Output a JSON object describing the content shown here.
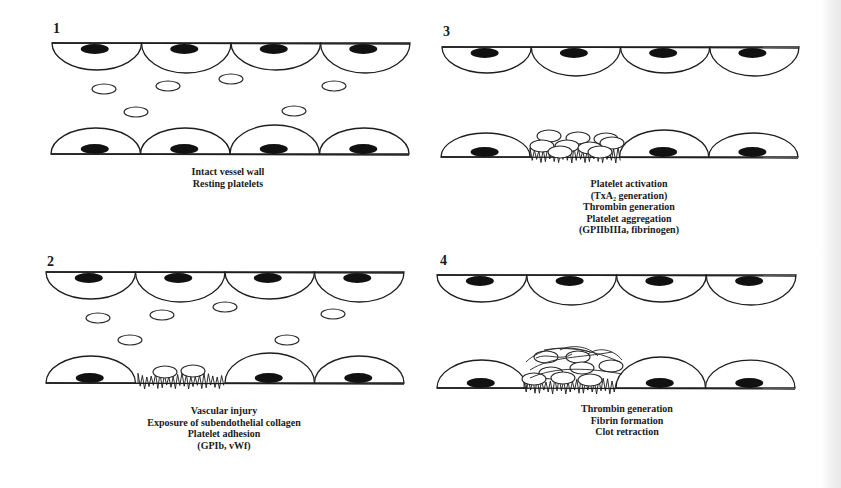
{
  "figure": {
    "panels": [
      {
        "id": "1",
        "label": "1",
        "label_pos": [
          53,
          33
        ],
        "top_wall": {
          "y": 43,
          "x0": 52,
          "x1": 410,
          "depth": 27
        },
        "bottom_wall": {
          "y": 154,
          "x0": 51,
          "x1": 409,
          "height": 26,
          "injury": false
        },
        "free_platelets": [
          [
            104,
            89
          ],
          [
            168,
            86
          ],
          [
            231,
            79
          ],
          [
            334,
            86
          ],
          [
            136,
            112
          ],
          [
            294,
            111
          ]
        ],
        "adherent_platelets": [],
        "fibrin": false,
        "caption_lines": [
          "Intact vessel wall",
          "Resting platelets"
        ],
        "caption_x": 228,
        "caption_y0": 175
      },
      {
        "id": "2",
        "label": "2",
        "label_pos": [
          47,
          266
        ],
        "top_wall": {
          "y": 272,
          "x0": 46,
          "x1": 404,
          "depth": 27
        },
        "bottom_wall": {
          "y": 383,
          "x0": 46,
          "x1": 404,
          "height": 27,
          "injury": true,
          "injury_x0": 138,
          "injury_x1": 225
        },
        "free_platelets": [
          [
            98,
            318
          ],
          [
            162,
            315
          ],
          [
            225,
            307
          ],
          [
            333,
            314
          ],
          [
            130,
            340
          ],
          [
            287,
            340
          ]
        ],
        "adherent_platelets": [
          [
            165,
            372
          ],
          [
            193,
            371
          ]
        ],
        "fibrin": false,
        "caption_lines": [
          "Vascular injury",
          "Exposure of subendothelial collagen",
          "Platelet adhesion",
          "(GPIb, vWf)"
        ],
        "caption_x": 224,
        "caption_y0": 414
      },
      {
        "id": "3",
        "label": "3",
        "label_pos": [
          443,
          36
        ],
        "top_wall": {
          "y": 47,
          "x0": 442,
          "x1": 799,
          "depth": 26
        },
        "bottom_wall": {
          "y": 157,
          "x0": 441,
          "x1": 798,
          "height": 24,
          "injury": true,
          "injury_x0": 530,
          "injury_x1": 621
        },
        "free_platelets": [],
        "adherent_platelets": [
          [
            549,
            136
          ],
          [
            578,
            138
          ],
          [
            606,
            139
          ],
          [
            542,
            146
          ],
          [
            567,
            146
          ],
          [
            590,
            148
          ],
          [
            612,
            143
          ],
          [
            560,
            152
          ],
          [
            600,
            152
          ]
        ],
        "fibrin": false,
        "caption_lines": [
          "Platelet activation",
          "(TxA₂ generation)",
          "Thrombin generation",
          "Platelet aggregation",
          "(GPIIbIIIa, fibrinogen)"
        ],
        "caption_x": 629,
        "caption_y0": 187
      },
      {
        "id": "4",
        "label": "4",
        "label_pos": [
          440,
          265
        ],
        "top_wall": {
          "y": 275,
          "x0": 437,
          "x1": 796,
          "depth": 27
        },
        "bottom_wall": {
          "y": 388,
          "x0": 437,
          "x1": 795,
          "height": 28,
          "injury": true,
          "injury_x0": 524,
          "injury_x1": 617
        },
        "free_platelets": [],
        "adherent_platelets": [
          [
            546,
            357
          ],
          [
            578,
            357
          ],
          [
            611,
            366
          ],
          [
            551,
            373
          ],
          [
            582,
            368
          ],
          [
            563,
            378
          ],
          [
            590,
            380
          ],
          [
            534,
            379
          ]
        ],
        "fibrin": true,
        "caption_lines": [
          "Thrombin generation",
          "Fibrin formation",
          "Clot retraction"
        ],
        "caption_x": 627,
        "caption_y0": 412
      }
    ]
  }
}
